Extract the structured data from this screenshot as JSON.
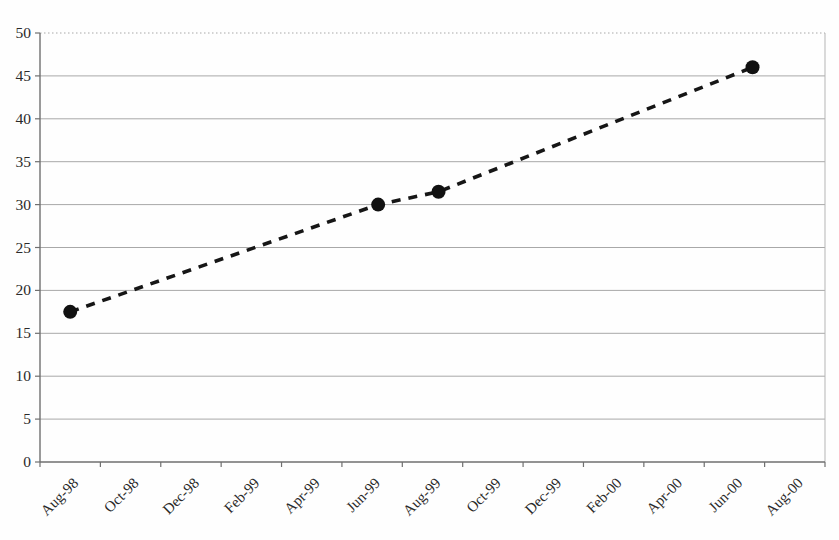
{
  "figure": {
    "title": "",
    "background_color": "#fefefe"
  },
  "chart_data": {
    "type": "line",
    "title": "",
    "xlabel": "",
    "ylabel": "",
    "categories": [
      "Aug-98",
      "Oct-98",
      "Dec-98",
      "Feb-99",
      "Apr-99",
      "Jun-99",
      "Aug-99",
      "Oct-99",
      "Dec-99",
      "Feb-00",
      "Apr-00",
      "Jun-00",
      "Aug-00"
    ],
    "y_tick_labels": [
      "0",
      "5",
      "10",
      "15",
      "20",
      "25",
      "30",
      "35",
      "40",
      "45",
      "50"
    ],
    "ylim": [
      0,
      50
    ],
    "ytick_step": 5,
    "grid": "horizontal",
    "legend": "none",
    "series": [
      {
        "name": "series-1",
        "line_style": "dashed",
        "marker": "circle",
        "points": [
          {
            "label": "Aug-98",
            "x_index": 0.0,
            "value": 17.5
          },
          {
            "label": "Jun-99",
            "x_index": 5.1,
            "value": 30
          },
          {
            "label": "Aug-99",
            "x_index": 6.1,
            "value": 31.5
          },
          {
            "label": "Jun-00",
            "x_index": 11.3,
            "value": 46
          }
        ]
      }
    ],
    "colors": {
      "line": "#161616",
      "marker": "#111111",
      "gridline": "#a8a8a8",
      "axis": "#6f6f6f",
      "text": "#2a2a2a",
      "plot_border": "#b5b5b5"
    }
  }
}
